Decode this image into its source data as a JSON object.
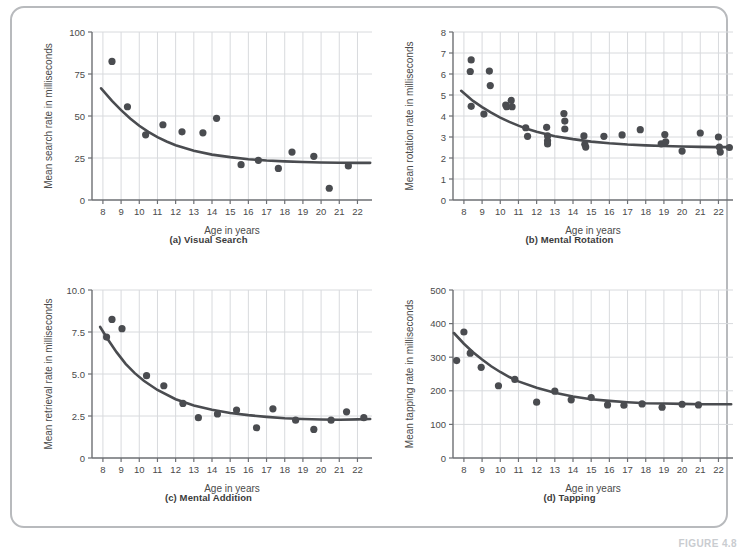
{
  "figure": {
    "label": "FIGURE 4.8",
    "x_axis_title": "Age in years",
    "panels": [
      {
        "key": "a",
        "caption": "(a) Visual Search",
        "y_axis_title": "Mean search rate in milliseconds"
      },
      {
        "key": "b",
        "caption": "(b) Mental Rotation",
        "y_axis_title": "Mean rotation rate in milliseconds"
      },
      {
        "key": "c",
        "caption": "(c) Mental Addition",
        "y_axis_title": "Mean retrieval rate in milliseconds"
      },
      {
        "key": "d",
        "caption": "(d) Tapping",
        "y_axis_title": "Mean tapping rate in milliseconds"
      }
    ],
    "colors": {
      "point": "#4a4c50",
      "curve": "#4a4c50",
      "grid": "#d8dadd",
      "axis": "#6d6f73",
      "frame": "#b8babd",
      "text": "#4a4a4a"
    }
  },
  "chart_data": [
    {
      "type": "scatter",
      "panel": "a",
      "title": "(a) Visual Search",
      "xlabel": "Age in years",
      "ylabel": "Mean search rate in milliseconds",
      "xlim": [
        7.4,
        22.8
      ],
      "ylim": [
        0,
        100
      ],
      "xticks": [
        8,
        9,
        10,
        11,
        12,
        13,
        14,
        15,
        16,
        17,
        18,
        19,
        20,
        21,
        22
      ],
      "yticks": [
        0,
        25,
        50,
        75,
        100
      ],
      "ytick_labels": [
        "0",
        "25",
        "50",
        "75",
        "100"
      ],
      "grid": "vertical-and-horizontal",
      "legend": "none",
      "x": [
        8.5,
        9.35,
        10.35,
        11.3,
        12.35,
        13.5,
        14.25,
        15.6,
        16.55,
        17.65,
        18.4,
        19.6,
        20.45,
        21.5
      ],
      "y": [
        82.5,
        55.5,
        38.8,
        44.8,
        40.6,
        40.0,
        48.6,
        21.0,
        23.6,
        18.8,
        28.5,
        26.0,
        7.0,
        20.3
      ],
      "fit_curve": {
        "description": "decreasing exponential-decay fit",
        "x": [
          7.9,
          8.5,
          9,
          9.5,
          10,
          10.5,
          11,
          11.5,
          12,
          13,
          14,
          15,
          16,
          17,
          18,
          19,
          20,
          21,
          22,
          22.7
        ],
        "y": [
          66.5,
          59.0,
          53.5,
          48.5,
          44.2,
          40.6,
          37.4,
          34.8,
          32.6,
          29.3,
          27.0,
          25.5,
          24.3,
          23.5,
          23.0,
          22.6,
          22.3,
          22.2,
          22.1,
          22.1
        ]
      }
    },
    {
      "type": "scatter",
      "panel": "b",
      "title": "(b) Mental Rotation",
      "xlabel": "Age in years",
      "ylabel": "Mean rotation rate in milliseconds",
      "xlim": [
        7.4,
        22.8
      ],
      "ylim": [
        0,
        8
      ],
      "xticks": [
        8,
        9,
        10,
        11,
        12,
        13,
        14,
        15,
        16,
        17,
        18,
        19,
        20,
        21,
        22
      ],
      "yticks": [
        0,
        1,
        2,
        3,
        4,
        5,
        6,
        7,
        8
      ],
      "ytick_labels": [
        "0",
        "1",
        "2",
        "3",
        "4",
        "5",
        "6",
        "7",
        "8"
      ],
      "grid": "vertical-and-horizontal",
      "legend": "none",
      "x": [
        8.4,
        8.35,
        8.4,
        9.4,
        9.45,
        9.1,
        10.3,
        10.35,
        10.6,
        10.65,
        11.4,
        11.5,
        12.55,
        12.6,
        12.6,
        12.6,
        13.5,
        13.55,
        13.55,
        14.6,
        14.65,
        14.7,
        15.7,
        16.7,
        17.7,
        18.85,
        19.05,
        19.1,
        20.0,
        21.0,
        22.0,
        22.05,
        22.1,
        22.6
      ],
      "y": [
        6.67,
        6.12,
        4.46,
        6.14,
        5.45,
        4.09,
        4.52,
        4.44,
        4.74,
        4.44,
        3.44,
        3.03,
        3.46,
        3.05,
        2.82,
        2.67,
        4.12,
        3.76,
        3.38,
        3.05,
        2.65,
        2.52,
        3.03,
        3.1,
        3.35,
        2.67,
        3.12,
        2.77,
        2.33,
        3.19,
        3.0,
        2.52,
        2.28,
        2.5
      ],
      "fit_curve": {
        "description": "decreasing exponential-decay fit",
        "x": [
          7.85,
          8.5,
          9,
          9.5,
          10,
          10.5,
          11,
          11.5,
          12,
          13,
          14,
          15,
          16,
          17,
          18,
          19,
          20,
          21,
          22,
          22.7
        ],
        "y": [
          5.2,
          4.72,
          4.42,
          4.16,
          3.92,
          3.72,
          3.54,
          3.38,
          3.25,
          3.04,
          2.9,
          2.78,
          2.7,
          2.64,
          2.6,
          2.57,
          2.55,
          2.53,
          2.52,
          2.52
        ]
      }
    },
    {
      "type": "scatter",
      "panel": "c",
      "title": "(c) Mental Addition",
      "xlabel": "Age in years",
      "ylabel": "Mean retrieval rate in milliseconds",
      "xlim": [
        7.4,
        22.8
      ],
      "ylim": [
        0,
        10
      ],
      "xticks": [
        8,
        9,
        10,
        11,
        12,
        13,
        14,
        15,
        16,
        17,
        18,
        19,
        20,
        21,
        22
      ],
      "yticks": [
        0,
        2.5,
        5.0,
        7.5,
        10.0
      ],
      "ytick_labels": [
        "0",
        "2.5",
        "5.0",
        "7.5",
        "10.0"
      ],
      "grid": "vertical-and-horizontal",
      "legend": "none",
      "x": [
        8.2,
        8.5,
        9.05,
        10.4,
        11.35,
        12.4,
        13.25,
        14.3,
        15.35,
        16.45,
        17.35,
        18.6,
        19.6,
        20.55,
        21.4,
        22.35
      ],
      "y": [
        7.2,
        8.25,
        7.7,
        4.9,
        4.3,
        3.25,
        2.4,
        2.62,
        2.85,
        1.8,
        2.93,
        2.25,
        1.7,
        2.25,
        2.75,
        2.4
      ],
      "fit_curve": {
        "description": "decreasing exponential-decay fit",
        "x": [
          7.85,
          8.25,
          8.75,
          9.25,
          9.75,
          10.25,
          11,
          12,
          13,
          14,
          15,
          16,
          17,
          18,
          19,
          20,
          21,
          22,
          22.7
        ],
        "y": [
          7.8,
          7.1,
          6.3,
          5.6,
          5.05,
          4.6,
          4.05,
          3.5,
          3.12,
          2.87,
          2.68,
          2.55,
          2.45,
          2.37,
          2.32,
          2.29,
          2.28,
          2.3,
          2.32
        ]
      }
    },
    {
      "type": "scatter",
      "panel": "d",
      "title": "(d) Tapping",
      "xlabel": "Age in years",
      "ylabel": "Mean tapping rate in milliseconds",
      "xlim": [
        7.4,
        22.8
      ],
      "ylim": [
        0,
        500
      ],
      "xticks": [
        8,
        9,
        10,
        11,
        12,
        13,
        14,
        15,
        16,
        17,
        18,
        19,
        20,
        21,
        22
      ],
      "yticks": [
        0,
        100,
        200,
        300,
        400,
        500
      ],
      "ytick_labels": [
        "0",
        "100",
        "200",
        "300",
        "400",
        "500"
      ],
      "grid": "vertical-and-horizontal",
      "legend": "none",
      "x": [
        7.6,
        8.0,
        8.35,
        8.95,
        9.9,
        10.8,
        12.0,
        13.0,
        13.9,
        15.0,
        15.9,
        16.8,
        17.8,
        18.9,
        20.0,
        20.9
      ],
      "y": [
        290,
        375,
        312,
        270,
        215,
        234,
        166,
        199,
        173,
        180,
        158,
        157,
        161,
        151,
        160,
        158
      ],
      "fit_curve": {
        "description": "decreasing exponential-decay fit",
        "x": [
          7.45,
          8,
          8.5,
          9,
          9.5,
          10,
          10.5,
          11,
          12,
          13,
          14,
          15,
          16,
          17,
          18,
          19,
          20,
          21,
          22,
          22.7
        ],
        "y": [
          372,
          340,
          315,
          293,
          273,
          256,
          241,
          228,
          209,
          194,
          183,
          175,
          170,
          166,
          163,
          162,
          161,
          160,
          160,
          160
        ]
      }
    }
  ]
}
